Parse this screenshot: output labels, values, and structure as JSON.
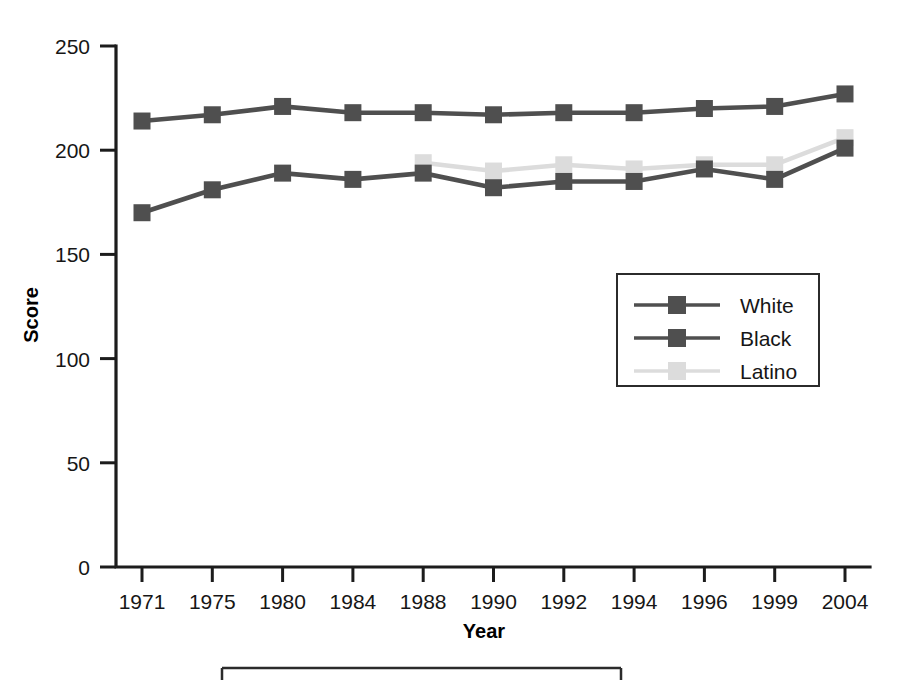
{
  "chart_data": {
    "type": "line",
    "title": "",
    "xlabel": "Year",
    "ylabel": "Score",
    "categories": [
      "1971",
      "1975",
      "1980",
      "1984",
      "1988",
      "1990",
      "1992",
      "1994",
      "1996",
      "1999",
      "2004"
    ],
    "ylim": [
      0,
      250
    ],
    "yticks": [
      0,
      50,
      100,
      150,
      200,
      250
    ],
    "ytick_labels": [
      "0",
      "50",
      "100",
      "150",
      "200",
      "250"
    ],
    "grid": false,
    "legend_position": "center-right",
    "marker": "square",
    "series": [
      {
        "name": "White",
        "color": "#4f4f4f",
        "values": [
          214,
          217,
          221,
          218,
          218,
          217,
          218,
          218,
          220,
          221,
          227
        ]
      },
      {
        "name": "Black",
        "color": "#4f4f4f",
        "values": [
          170,
          181,
          189,
          186,
          189,
          182,
          185,
          185,
          191,
          186,
          201
        ]
      },
      {
        "name": "Latino",
        "color": "#dcdcdc",
        "values": [
          null,
          null,
          null,
          null,
          194,
          190,
          193,
          191,
          193,
          193,
          206
        ]
      }
    ]
  },
  "axes": {
    "y_title": "Score",
    "x_title": "Year"
  },
  "legend": {
    "entries": [
      {
        "label": "White",
        "color": "#4f4f4f"
      },
      {
        "label": "Black",
        "color": "#4f4f4f"
      },
      {
        "label": "Latino",
        "color": "#dcdcdc"
      }
    ]
  }
}
